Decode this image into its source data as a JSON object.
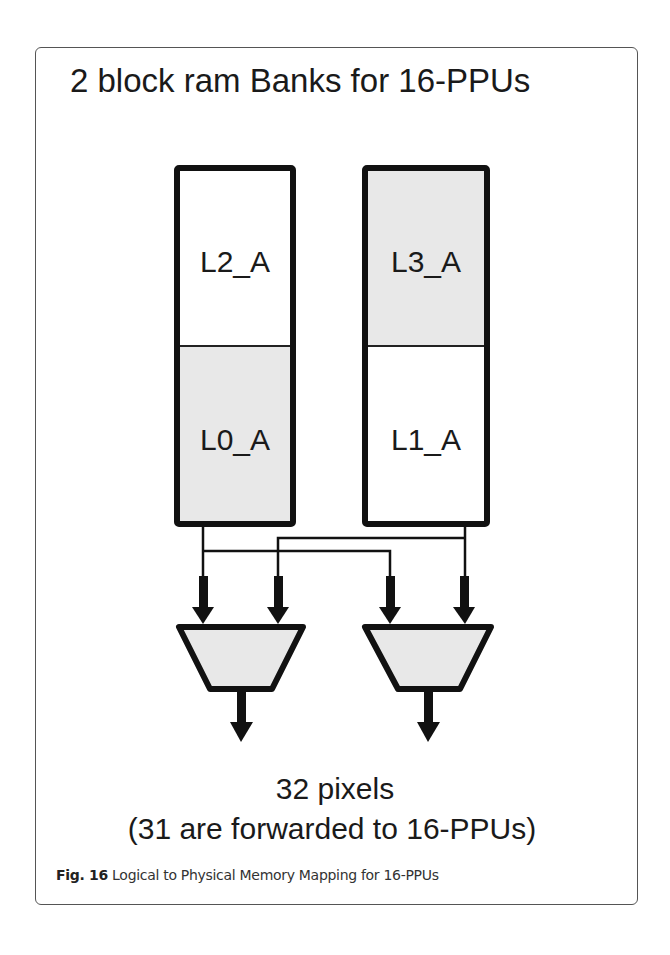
{
  "figure": {
    "title": "2 block ram Banks for 16-PPUs",
    "banks": [
      {
        "name": "left-bank",
        "segments": [
          {
            "label": "L2_A",
            "position": "top",
            "fill": "#ffffff"
          },
          {
            "label": "L0_A",
            "position": "bottom",
            "fill": "#e8e8e8"
          }
        ]
      },
      {
        "name": "right-bank",
        "segments": [
          {
            "label": "L3_A",
            "position": "top",
            "fill": "#e8e8e8"
          },
          {
            "label": "L1_A",
            "position": "bottom",
            "fill": "#ffffff"
          }
        ]
      }
    ],
    "multiplexers": [
      {
        "name": "mux-left",
        "inputs": [
          "left-bank",
          "right-bank"
        ],
        "fill": "#e8e8e8"
      },
      {
        "name": "mux-right",
        "inputs": [
          "left-bank",
          "right-bank"
        ],
        "fill": "#e8e8e8"
      }
    ],
    "output_line1": "32 pixels",
    "output_line2": "(31 are forwarded to 16-PPUs)",
    "caption_label": "Fig. 16",
    "caption_text": " Logical to Physical Memory Mapping for 16-PPUs"
  },
  "colors": {
    "stroke": "#111111",
    "shaded_fill": "#e8e8e8",
    "frame": "#555555"
  }
}
